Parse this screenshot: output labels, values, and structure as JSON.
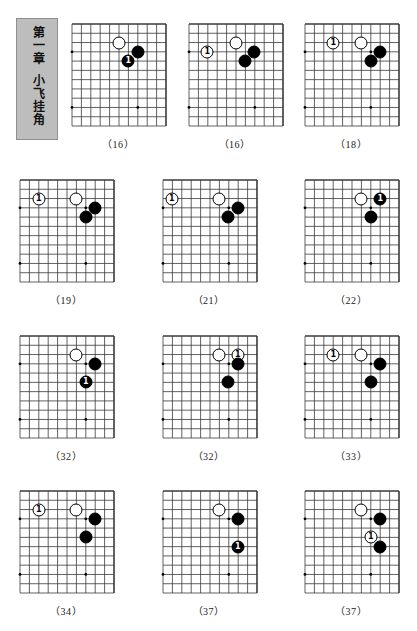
{
  "page": {
    "width": 417,
    "height": 631,
    "background_color": "#ffffff",
    "ink_color": "#000000",
    "grid_line_color": "#3a3a3a"
  },
  "chapter": {
    "box_color": "#bdbdbd",
    "number_text": "第一章",
    "title_text": "小飞挂角"
  },
  "board_spec": {
    "cols": 10,
    "rows": 11,
    "corner": "top-right",
    "star_points_note": "left-edge star and bottom star dots visible"
  },
  "diagrams": [
    {
      "id": "diagram-1",
      "caption": "（16）",
      "stones": [
        {
          "color": "white",
          "col": 5,
          "row": 2,
          "label": ""
        },
        {
          "color": "black",
          "col": 7,
          "row": 3,
          "label": ""
        },
        {
          "color": "black",
          "col": 6,
          "row": 4,
          "label": "1"
        }
      ]
    },
    {
      "id": "diagram-2",
      "caption": "（16）",
      "stones": [
        {
          "color": "white",
          "col": 2,
          "row": 3,
          "label": "1"
        },
        {
          "color": "white",
          "col": 5,
          "row": 2,
          "label": ""
        },
        {
          "color": "black",
          "col": 7,
          "row": 3,
          "label": ""
        },
        {
          "color": "black",
          "col": 6,
          "row": 4,
          "label": ""
        }
      ]
    },
    {
      "id": "diagram-3",
      "caption": "（18）",
      "stones": [
        {
          "color": "white",
          "col": 3,
          "row": 2,
          "label": "1"
        },
        {
          "color": "white",
          "col": 6,
          "row": 2,
          "label": ""
        },
        {
          "color": "black",
          "col": 8,
          "row": 3,
          "label": ""
        },
        {
          "color": "black",
          "col": 7,
          "row": 4,
          "label": ""
        }
      ]
    },
    {
      "id": "diagram-4",
      "caption": "（19）",
      "stones": [
        {
          "color": "white",
          "col": 2,
          "row": 2,
          "label": "1"
        },
        {
          "color": "white",
          "col": 6,
          "row": 2,
          "label": ""
        },
        {
          "color": "black",
          "col": 8,
          "row": 3,
          "label": ""
        },
        {
          "color": "black",
          "col": 7,
          "row": 4,
          "label": ""
        }
      ]
    },
    {
      "id": "diagram-5",
      "caption": "（21）",
      "stones": [
        {
          "color": "white",
          "col": 1,
          "row": 2,
          "label": "1"
        },
        {
          "color": "white",
          "col": 6,
          "row": 2,
          "label": ""
        },
        {
          "color": "black",
          "col": 8,
          "row": 3,
          "label": ""
        },
        {
          "color": "black",
          "col": 7,
          "row": 4,
          "label": ""
        }
      ]
    },
    {
      "id": "diagram-6",
      "caption": "（22）",
      "stones": [
        {
          "color": "white",
          "col": 6,
          "row": 2,
          "label": ""
        },
        {
          "color": "black",
          "col": 8,
          "row": 2,
          "label": "1"
        },
        {
          "color": "black",
          "col": 7,
          "row": 4,
          "label": ""
        }
      ]
    },
    {
      "id": "diagram-7",
      "caption": "（32）",
      "stones": [
        {
          "color": "white",
          "col": 6,
          "row": 2,
          "label": ""
        },
        {
          "color": "black",
          "col": 8,
          "row": 3,
          "label": ""
        },
        {
          "color": "black",
          "col": 7,
          "row": 5,
          "label": "1"
        }
      ]
    },
    {
      "id": "diagram-8",
      "caption": "（32）",
      "stones": [
        {
          "color": "white",
          "col": 6,
          "row": 2,
          "label": ""
        },
        {
          "color": "white",
          "col": 8,
          "row": 2,
          "label": "1"
        },
        {
          "color": "black",
          "col": 8,
          "row": 3,
          "label": ""
        },
        {
          "color": "black",
          "col": 7,
          "row": 5,
          "label": ""
        }
      ]
    },
    {
      "id": "diagram-9",
      "caption": "（33）",
      "stones": [
        {
          "color": "white",
          "col": 3,
          "row": 2,
          "label": "1"
        },
        {
          "color": "white",
          "col": 6,
          "row": 2,
          "label": ""
        },
        {
          "color": "black",
          "col": 8,
          "row": 3,
          "label": ""
        },
        {
          "color": "black",
          "col": 7,
          "row": 5,
          "label": ""
        }
      ]
    },
    {
      "id": "diagram-10",
      "caption": "（34）",
      "stones": [
        {
          "color": "white",
          "col": 2,
          "row": 2,
          "label": "1"
        },
        {
          "color": "white",
          "col": 6,
          "row": 2,
          "label": ""
        },
        {
          "color": "black",
          "col": 8,
          "row": 3,
          "label": ""
        },
        {
          "color": "black",
          "col": 7,
          "row": 5,
          "label": ""
        }
      ]
    },
    {
      "id": "diagram-11",
      "caption": "（37）",
      "stones": [
        {
          "color": "white",
          "col": 6,
          "row": 2,
          "label": ""
        },
        {
          "color": "black",
          "col": 8,
          "row": 3,
          "label": ""
        },
        {
          "color": "black",
          "col": 8,
          "row": 6,
          "label": "1"
        }
      ]
    },
    {
      "id": "diagram-12",
      "caption": "（37）",
      "stones": [
        {
          "color": "white",
          "col": 6,
          "row": 2,
          "label": ""
        },
        {
          "color": "black",
          "col": 8,
          "row": 3,
          "label": ""
        },
        {
          "color": "white",
          "col": 7,
          "row": 5,
          "label": "1"
        },
        {
          "color": "black",
          "col": 8,
          "row": 6,
          "label": ""
        }
      ]
    }
  ]
}
